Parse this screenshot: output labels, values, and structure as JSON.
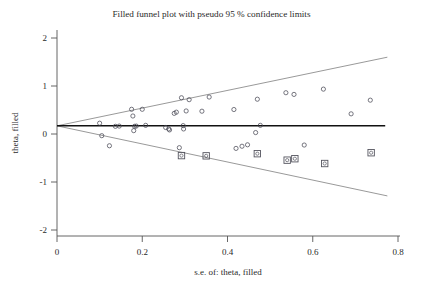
{
  "chart_data": {
    "type": "scatter",
    "title": "Filled funnel plot with pseudo 95 % confidence limits",
    "xlabel": "s.e. of: theta, filled",
    "ylabel": "theta, filled",
    "xlim": [
      0.0,
      0.8
    ],
    "ylim": [
      -2.0,
      2.0
    ],
    "xticks": [
      0,
      0.2,
      0.4,
      0.6,
      0.8
    ],
    "xticklabels": [
      "0",
      "0.2",
      "0.4",
      "0.6",
      "0.8"
    ],
    "yticks": [
      2,
      1,
      0,
      -1,
      -2
    ],
    "yticklabels": [
      "2",
      "1",
      "0",
      "-1",
      "-2"
    ],
    "grid": false,
    "legend": "none",
    "pooled_effect": 0.17,
    "center_line": {
      "y": 0.17,
      "x_start": 0.0,
      "x_end": 0.77
    },
    "funnel_limits": {
      "upper": {
        "x": [
          0.0,
          0.775
        ],
        "y": [
          0.17,
          1.6
        ]
      },
      "lower": {
        "x": [
          0.0,
          0.775
        ],
        "y": [
          0.17,
          -1.29
        ]
      }
    },
    "series": [
      {
        "name": "Observed studies",
        "marker": "open-circle",
        "points": [
          {
            "x": 0.1,
            "y": 0.225
          },
          {
            "x": 0.105,
            "y": -0.035
          },
          {
            "x": 0.123,
            "y": -0.245
          },
          {
            "x": 0.137,
            "y": 0.16
          },
          {
            "x": 0.146,
            "y": 0.165
          },
          {
            "x": 0.175,
            "y": 0.515
          },
          {
            "x": 0.178,
            "y": 0.375
          },
          {
            "x": 0.18,
            "y": 0.07
          },
          {
            "x": 0.182,
            "y": 0.16
          },
          {
            "x": 0.186,
            "y": 0.165
          },
          {
            "x": 0.2,
            "y": 0.515
          },
          {
            "x": 0.208,
            "y": 0.18
          },
          {
            "x": 0.255,
            "y": 0.135
          },
          {
            "x": 0.262,
            "y": 0.105
          },
          {
            "x": 0.264,
            "y": 0.085
          },
          {
            "x": 0.275,
            "y": 0.43
          },
          {
            "x": 0.28,
            "y": 0.455
          },
          {
            "x": 0.287,
            "y": -0.285
          },
          {
            "x": 0.292,
            "y": 0.755
          },
          {
            "x": 0.296,
            "y": 0.175
          },
          {
            "x": 0.297,
            "y": 0.105
          },
          {
            "x": 0.303,
            "y": 0.48
          },
          {
            "x": 0.31,
            "y": 0.715
          },
          {
            "x": 0.34,
            "y": 0.475
          },
          {
            "x": 0.357,
            "y": 0.77
          },
          {
            "x": 0.415,
            "y": 0.51
          },
          {
            "x": 0.42,
            "y": -0.3
          },
          {
            "x": 0.434,
            "y": -0.255
          },
          {
            "x": 0.447,
            "y": -0.225
          },
          {
            "x": 0.466,
            "y": 0.03
          },
          {
            "x": 0.47,
            "y": 0.725
          },
          {
            "x": 0.477,
            "y": 0.18
          },
          {
            "x": 0.537,
            "y": 0.86
          },
          {
            "x": 0.556,
            "y": 0.825
          },
          {
            "x": 0.58,
            "y": -0.23
          },
          {
            "x": 0.625,
            "y": 0.935
          },
          {
            "x": 0.69,
            "y": 0.42
          },
          {
            "x": 0.735,
            "y": 0.705
          }
        ]
      },
      {
        "name": "Filled (imputed) studies",
        "marker": "circle-in-square",
        "points": [
          {
            "x": 0.292,
            "y": -0.45
          },
          {
            "x": 0.35,
            "y": -0.455
          },
          {
            "x": 0.47,
            "y": -0.41
          },
          {
            "x": 0.54,
            "y": -0.545
          },
          {
            "x": 0.558,
            "y": -0.515
          },
          {
            "x": 0.628,
            "y": -0.615
          },
          {
            "x": 0.737,
            "y": -0.39
          }
        ]
      }
    ]
  }
}
